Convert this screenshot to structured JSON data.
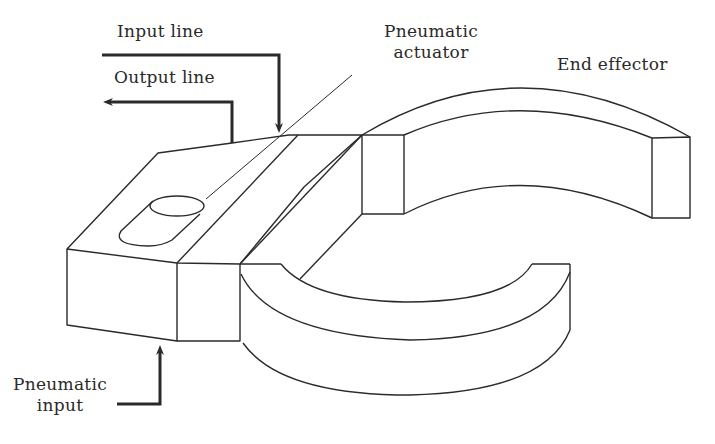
{
  "diagram": {
    "type": "mechanical-illustration",
    "labels": {
      "input_line": "Input line",
      "output_line": "Output line",
      "pneumatic_actuator_1": "Pneumatic",
      "pneumatic_actuator_2": "actuator",
      "end_effector": "End effector",
      "pneumatic_input_1": "Pneumatic",
      "pneumatic_input_2": "input"
    },
    "colors": {
      "line": "#2a2a2a",
      "background": "#ffffff"
    }
  }
}
